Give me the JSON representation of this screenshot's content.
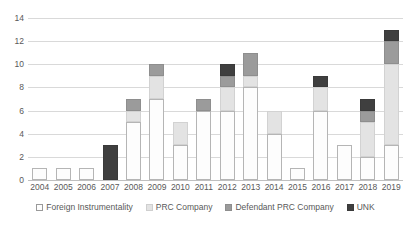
{
  "chart_data": {
    "type": "bar",
    "subtype": "stacked-bar",
    "title": "",
    "xlabel": "",
    "ylabel": "",
    "ylim": [
      0,
      14
    ],
    "ytick_step": 2,
    "yticks": [
      "0",
      "2",
      "4",
      "6",
      "8",
      "10",
      "12",
      "14"
    ],
    "grid": true,
    "legend_position": "bottom",
    "categories": [
      "2004",
      "2005",
      "2006",
      "2007",
      "2008",
      "2009",
      "2010",
      "2011",
      "2012",
      "2013",
      "2014",
      "2015",
      "2016",
      "2017",
      "2018",
      "2019"
    ],
    "series": [
      {
        "name": "Foreign Instrumentality",
        "key": "fi",
        "color": "#fdfdfd",
        "border_color": "#b5b5b5",
        "values": [
          1,
          1,
          1,
          0,
          5,
          7,
          3,
          6,
          6,
          8,
          4,
          1,
          6,
          3,
          2,
          3
        ]
      },
      {
        "name": "PRC Company",
        "key": "prc",
        "color": "#e3e3e3",
        "border_color": "#d2d2d2",
        "values": [
          0,
          0,
          0,
          0,
          1,
          2,
          2,
          0,
          2,
          1,
          2,
          0,
          2,
          0,
          3,
          7
        ]
      },
      {
        "name": "Defendant PRC Company",
        "key": "def",
        "color": "#9b9b9b",
        "border_color": "#8e8e8e",
        "values": [
          0,
          0,
          0,
          0,
          1,
          1,
          0,
          1,
          1,
          2,
          0,
          0,
          0,
          0,
          1,
          2
        ]
      },
      {
        "name": "UNK",
        "key": "unk",
        "color": "#3f3f3f",
        "border_color": "#3a3a3a",
        "values": [
          0,
          0,
          0,
          3,
          0,
          0,
          0,
          0,
          1,
          0,
          0,
          0,
          1,
          0,
          1,
          1
        ]
      }
    ],
    "totals": [
      1,
      1,
      1,
      3,
      7,
      10,
      5,
      7,
      10,
      11,
      6,
      1,
      9,
      3,
      7,
      13
    ]
  },
  "legend": {
    "items": [
      {
        "label": "Foreign Instrumentality",
        "key": "fi"
      },
      {
        "label": "PRC Company",
        "key": "prc"
      },
      {
        "label": "Defendant PRC Company",
        "key": "def"
      },
      {
        "label": "UNK",
        "key": "unk"
      }
    ]
  }
}
